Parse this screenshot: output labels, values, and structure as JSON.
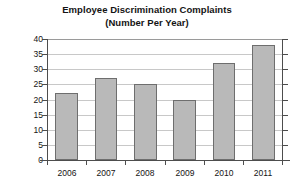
{
  "chart_data": {
    "type": "bar",
    "title": "Employee Discrimination Complaints",
    "subtitle": "(Number Per Year)",
    "xlabel": "",
    "ylabel": "Number of Complaints",
    "categories": [
      "2006",
      "2007",
      "2008",
      "2009",
      "2010",
      "2011"
    ],
    "values": [
      22,
      27,
      25,
      20,
      32,
      38
    ],
    "ylim": [
      0,
      40
    ],
    "ytick_labels": [
      "0",
      "5",
      "10",
      "15",
      "20",
      "25",
      "30",
      "35",
      "40"
    ],
    "ytick_values": [
      0,
      5,
      10,
      15,
      20,
      25,
      30,
      35,
      40
    ],
    "grid": true,
    "legend": false,
    "bar_color": "#b9b9b9",
    "bar_border_color": "#6e6e6e",
    "grid_color": "#c8c8c8",
    "axis_color": "#4d4d4d",
    "background": "#ffffff"
  }
}
